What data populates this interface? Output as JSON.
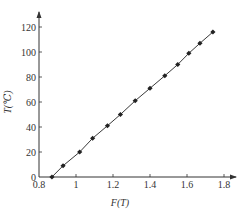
{
  "chart_data": {
    "type": "line",
    "title": "",
    "xlabel": "F(T)",
    "ylabel": "T(℃)",
    "xlim": [
      0.8,
      1.88
    ],
    "ylim": [
      0,
      128
    ],
    "xticks": [
      0.8,
      1,
      1.2,
      1.4,
      1.6,
      1.8
    ],
    "xtick_labels": [
      "0.8",
      "1",
      "1.2",
      "1.4",
      "1.6",
      "1.8"
    ],
    "yticks": [
      0,
      20,
      40,
      60,
      80,
      100,
      120
    ],
    "ytick_labels": [
      "0",
      "20",
      "40",
      "60",
      "80",
      "100",
      "120"
    ],
    "grid": false,
    "legend": null,
    "series": [
      {
        "name": "T vs F(T)",
        "marker": "diamond",
        "line": true,
        "color": "#222222",
        "x": [
          0.87,
          0.93,
          1.02,
          1.09,
          1.17,
          1.24,
          1.32,
          1.4,
          1.48,
          1.55,
          1.61,
          1.67,
          1.74
        ],
        "y": [
          0,
          9,
          20,
          31,
          41,
          50,
          61,
          71,
          81,
          90,
          99,
          107,
          116
        ]
      }
    ]
  }
}
